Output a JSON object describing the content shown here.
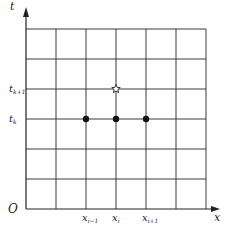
{
  "diagram": {
    "type": "finite-difference-stencil",
    "grid": {
      "columns": 6,
      "rows": 6
    },
    "axes": {
      "x_label": "x",
      "t_label": "t",
      "origin_label": "O"
    },
    "x_ticks": [
      {
        "col": 2,
        "label": "x",
        "sub": "i−1"
      },
      {
        "col": 3,
        "label": "x",
        "sub": "i"
      },
      {
        "col": 4,
        "label": "x",
        "sub": "i+1"
      }
    ],
    "t_ticks": [
      {
        "row": 3,
        "label": "t",
        "sub": "k"
      },
      {
        "row": 4,
        "label": "t",
        "sub": "k+1"
      }
    ],
    "nodes": [
      {
        "col": 2,
        "row": 3,
        "kind": "dot"
      },
      {
        "col": 3,
        "row": 3,
        "kind": "dot"
      },
      {
        "col": 4,
        "row": 3,
        "kind": "dot"
      },
      {
        "col": 3,
        "row": 4,
        "kind": "star"
      }
    ],
    "colors": {
      "line": "#3a3a3a",
      "dot": "#111111",
      "star": "#333333"
    }
  }
}
